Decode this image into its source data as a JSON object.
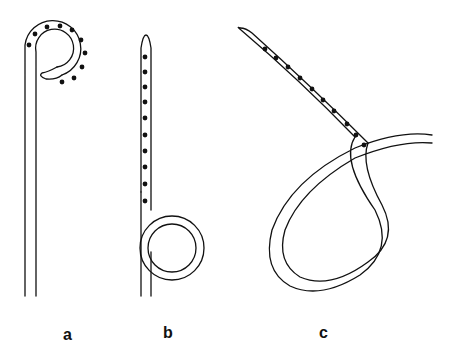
{
  "figure": {
    "panels": [
      {
        "id": "a",
        "label": "a",
        "description": "pigtail catheter with side holes on curl",
        "side_holes": 10
      },
      {
        "id": "b",
        "label": "b",
        "description": "straight catheter with side holes and loop",
        "side_holes": 10
      },
      {
        "id": "c",
        "label": "c",
        "description": "catheter with large loop and side holes",
        "side_holes": 10
      }
    ],
    "colors": {
      "stroke": "#111111",
      "hole": "#111111",
      "background": "#ffffff"
    }
  }
}
